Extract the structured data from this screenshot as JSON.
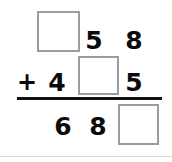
{
  "worksheet": {
    "type": "vertical-addition-problem",
    "operator": "+",
    "colors": {
      "ink": "#0b0b0b",
      "box_border": "#9c9c9c",
      "rule": "#111111",
      "background": "#ffffff"
    },
    "rows": {
      "addend1": {
        "hundreds": "",
        "hundreds_is_blank": true,
        "tens": "5",
        "ones": "8"
      },
      "addend2": {
        "operator": "+",
        "hundreds": "4",
        "tens": "",
        "tens_is_blank": true,
        "ones": "5"
      },
      "sum": {
        "hundreds": "6",
        "tens": "8",
        "ones": "",
        "ones_is_blank": true
      }
    },
    "blank_boxes": [
      {
        "name": "addend1-hundreds-box",
        "row": "addend1",
        "place": "hundreds"
      },
      {
        "name": "addend2-tens-box",
        "row": "addend2",
        "place": "tens"
      },
      {
        "name": "sum-ones-box",
        "row": "sum",
        "place": "ones"
      }
    ]
  }
}
